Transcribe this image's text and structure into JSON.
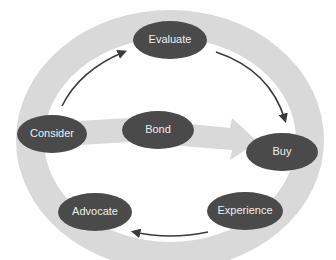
{
  "diagram": {
    "type": "cycle",
    "colors": {
      "background": "#ffffff",
      "ring": "#d9d9d9",
      "node_fill": "#4a4a4a",
      "node_text": "#eeeeee",
      "arrow": "#3a3a3a"
    },
    "nodes": [
      {
        "id": "evaluate",
        "label": "Evaluate"
      },
      {
        "id": "consider",
        "label": "Consider"
      },
      {
        "id": "bond",
        "label": "Bond"
      },
      {
        "id": "buy",
        "label": "Buy"
      },
      {
        "id": "advocate",
        "label": "Advocate"
      },
      {
        "id": "experience",
        "label": "Experience"
      }
    ],
    "edges": [
      {
        "from": "Consider",
        "to": "Evaluate",
        "style": "thin-arrow"
      },
      {
        "from": "Evaluate",
        "to": "Buy",
        "style": "thin-arrow"
      },
      {
        "from": "Experience",
        "to": "Advocate",
        "style": "thin-arrow"
      },
      {
        "from": "Consider",
        "to": "Buy",
        "via": "Bond",
        "style": "wide-shaded-arrow"
      }
    ]
  }
}
